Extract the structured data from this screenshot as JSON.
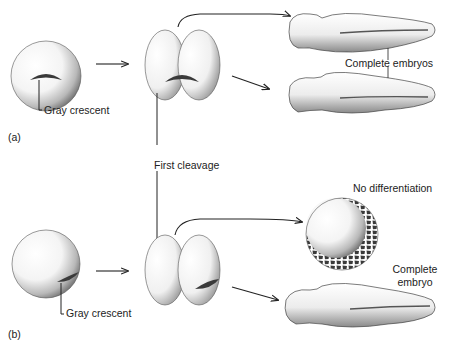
{
  "diagram": {
    "panels": [
      {
        "id": "a",
        "tag": "(a)",
        "egg_label": "Gray crescent",
        "outcomes": [
          "Complete embryos"
        ]
      },
      {
        "id": "b",
        "tag": "(b)",
        "egg_label": "Gray crescent",
        "outcomes": [
          "No differentiation",
          "Complete embryo"
        ]
      }
    ],
    "shared_label": "First cleavage",
    "labels": {
      "a_tag": "(a)",
      "a_gray_crescent": "Gray crescent",
      "a_complete_embryos": "Complete embryos",
      "first_cleavage": "First cleavage",
      "b_tag": "(b)",
      "b_gray_crescent": "Gray crescent",
      "b_no_differentiation": "No differentiation",
      "b_complete_embryo_line1": "Complete",
      "b_complete_embryo_line2": "embryo"
    },
    "colors": {
      "ink": "#222222",
      "crescent": "#3a3a3a",
      "background": "#ffffff"
    }
  }
}
